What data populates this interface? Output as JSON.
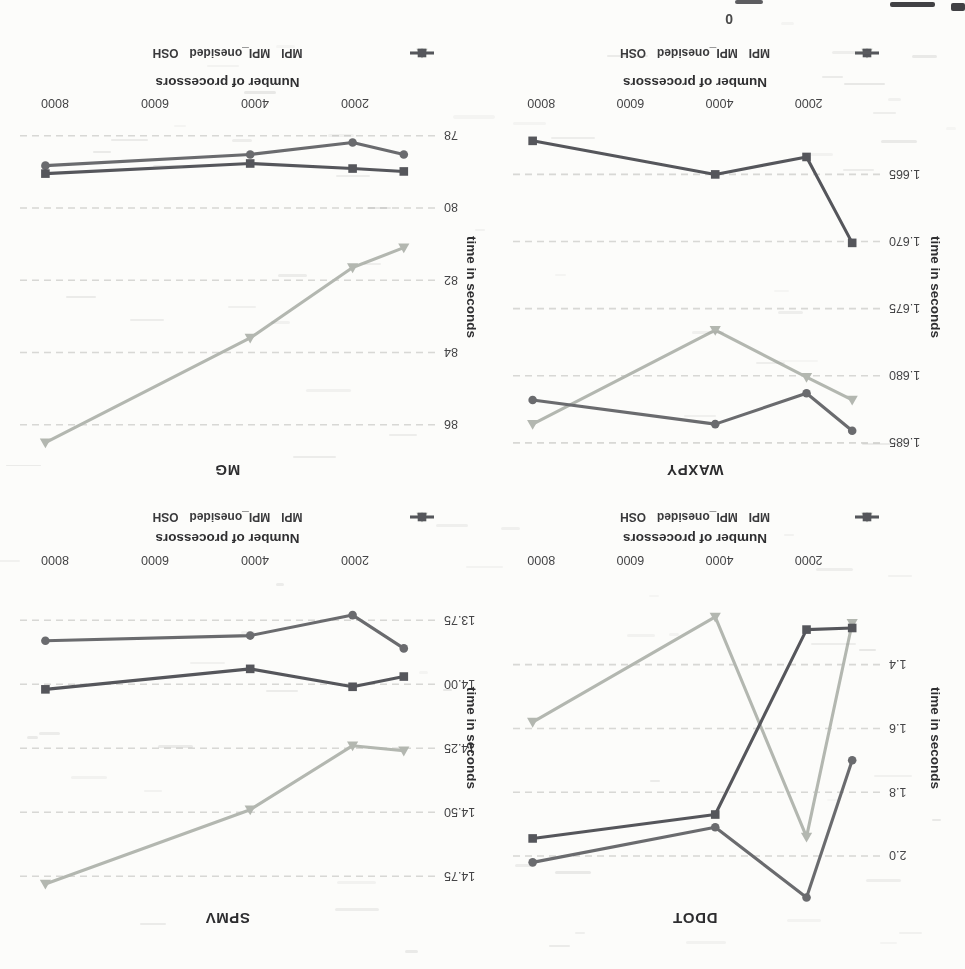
{
  "page": {
    "artifact_text": "0"
  },
  "axis": {
    "xlabel": "Number of processors",
    "ylabel": "time in seconds"
  },
  "legend": {
    "items": [
      {
        "label": "MPI",
        "marker": "circle",
        "color": "#6a6b6e"
      },
      {
        "label": "MPI_onesided",
        "marker": "triangle",
        "color": "#b3b7b0"
      },
      {
        "label": "OSH",
        "marker": "square",
        "color": "#55565b"
      }
    ]
  },
  "colors": {
    "grid": "#ccccc8",
    "tick_text": "#454547",
    "background": "#fcfcfa"
  },
  "chart_data": [
    {
      "type": "line",
      "title": "DDOT",
      "xlabel": "Number of processors",
      "ylabel": "time in seconds",
      "x": [
        1024,
        2048,
        4096,
        8192
      ],
      "xticks": [
        2000,
        4000,
        6000,
        8000
      ],
      "xtick_labels": [
        "2000",
        "4000",
        "6000",
        "8000"
      ],
      "xlim": [
        400,
        8700
      ],
      "ytick_values": [
        1.4,
        1.6,
        1.8,
        2.0
      ],
      "ytick_labels": [
        "1.4",
        "1.6",
        "1.8",
        "2.0"
      ],
      "ylim": [
        1.1,
        2.16
      ],
      "grid": true,
      "legend_position": "bottom",
      "series": [
        {
          "name": "MPI_onesided",
          "marker": "triangle",
          "color": "#b3b7b0",
          "values": [
            1.27,
            1.94,
            1.25,
            1.58
          ]
        },
        {
          "name": "MPI",
          "marker": "circle",
          "color": "#6a6b6e",
          "values": [
            1.7,
            2.13,
            1.91,
            2.02
          ]
        },
        {
          "name": "OSH",
          "marker": "square",
          "color": "#55565b",
          "values": [
            1.285,
            1.29,
            1.87,
            1.945
          ]
        }
      ]
    },
    {
      "type": "line",
      "title": "SPMV",
      "xlabel": "Number of processors",
      "ylabel": "time in seconds",
      "x": [
        1024,
        2048,
        4096,
        8192
      ],
      "xticks": [
        2000,
        4000,
        6000,
        8000
      ],
      "xtick_labels": [
        "2000",
        "4000",
        "6000",
        "8000"
      ],
      "xlim": [
        400,
        8700
      ],
      "ytick_values": [
        13.75,
        14.0,
        14.25,
        14.5,
        14.75
      ],
      "ytick_labels": [
        "13.75",
        "14.00",
        "14.25",
        "14.50",
        "14.75"
      ],
      "ylim": [
        13.55,
        14.87
      ],
      "grid": true,
      "legend_position": "bottom",
      "series": [
        {
          "name": "MPI_onesided",
          "marker": "triangle",
          "color": "#b3b7b0",
          "values": [
            14.26,
            14.24,
            14.49,
            14.78
          ]
        },
        {
          "name": "MPI",
          "marker": "circle",
          "color": "#6a6b6e",
          "values": [
            13.86,
            13.73,
            13.81,
            13.83
          ]
        },
        {
          "name": "OSH",
          "marker": "square",
          "color": "#55565b",
          "values": [
            13.97,
            14.01,
            13.94,
            14.02
          ]
        }
      ]
    },
    {
      "type": "line",
      "title": "WAXPY",
      "xlabel": "Number of processors",
      "ylabel": "time in seconds",
      "x": [
        1024,
        2048,
        4096,
        8192
      ],
      "xticks": [
        2000,
        4000,
        6000,
        8000
      ],
      "xtick_labels": [
        "2000",
        "4000",
        "6000",
        "8000"
      ],
      "xlim": [
        400,
        8700
      ],
      "ytick_values": [
        1.665,
        1.67,
        1.675,
        1.68,
        1.685
      ],
      "ytick_labels": [
        "1.665",
        "1.670",
        "1.675",
        "1.680",
        "1.685"
      ],
      "ylim": [
        1.6605,
        1.6862
      ],
      "grid": true,
      "legend_position": "bottom",
      "series": [
        {
          "name": "MPI_onesided",
          "marker": "triangle",
          "color": "#b3b7b0",
          "values": [
            1.6818,
            1.6801,
            1.6766,
            1.6836
          ]
        },
        {
          "name": "MPI",
          "marker": "circle",
          "color": "#6a6b6e",
          "values": [
            1.6841,
            1.6813,
            1.6836,
            1.6818
          ]
        },
        {
          "name": "OSH",
          "marker": "square",
          "color": "#55565b",
          "values": [
            1.6701,
            1.6637,
            1.665,
            1.6625
          ]
        }
      ]
    },
    {
      "type": "line",
      "title": "MG",
      "xlabel": "Number of processors",
      "ylabel": "time in seconds",
      "x": [
        1024,
        2048,
        4096,
        8192
      ],
      "xticks": [
        2000,
        4000,
        6000,
        8000
      ],
      "xtick_labels": [
        "2000",
        "4000",
        "6000",
        "8000"
      ],
      "xlim": [
        400,
        8700
      ],
      "ytick_values": [
        78,
        80,
        82,
        84,
        86
      ],
      "ytick_labels": [
        "78",
        "80",
        "82",
        "84",
        "86"
      ],
      "ylim": [
        77.4,
        86.95
      ],
      "grid": true,
      "legend_position": "bottom",
      "series": [
        {
          "name": "MPI_onesided",
          "marker": "triangle",
          "color": "#b3b7b0",
          "values": [
            81.1,
            81.65,
            83.6,
            86.5
          ]
        },
        {
          "name": "MPI",
          "marker": "circle",
          "color": "#6a6b6e",
          "values": [
            78.52,
            78.19,
            78.52,
            78.83
          ]
        },
        {
          "name": "OSH",
          "marker": "square",
          "color": "#55565b",
          "values": [
            78.99,
            78.91,
            78.77,
            79.05
          ]
        }
      ]
    }
  ]
}
